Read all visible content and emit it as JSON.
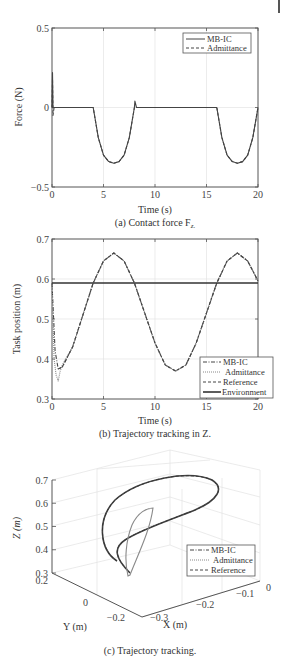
{
  "chart_data": [
    {
      "id": "a",
      "type": "line",
      "title": "",
      "caption": "(a) Contact force F",
      "caption_subscript": "z.",
      "xlabel": "Time (s)",
      "ylabel": "Force (N)",
      "xlim": [
        0,
        20
      ],
      "ylim": [
        -0.5,
        0.5
      ],
      "xticks": [
        "0",
        "5",
        "10",
        "15",
        "20"
      ],
      "yticks": [
        "-0.5",
        "0",
        "0.5"
      ],
      "grid": true,
      "legend_position": "upper right",
      "legend": [
        "MB-IC",
        "Admittance"
      ],
      "series": [
        {
          "name": "MB-IC",
          "style": "solid",
          "color": "#444444",
          "x": [
            0,
            0.05,
            0.1,
            0.2,
            4,
            4.5,
            5,
            5.5,
            6,
            6.5,
            7,
            7.5,
            8,
            8.05,
            8.2,
            16,
            16.5,
            17,
            17.5,
            18,
            18.5,
            19,
            19.5,
            20
          ],
          "y": [
            0,
            0.22,
            0,
            0,
            0,
            -0.19,
            -0.3,
            -0.34,
            -0.35,
            -0.34,
            -0.3,
            -0.19,
            0,
            0.04,
            0,
            0,
            -0.19,
            -0.3,
            -0.34,
            -0.35,
            -0.34,
            -0.3,
            -0.19,
            0
          ]
        },
        {
          "name": "Admittance",
          "style": "dashed",
          "color": "#444444",
          "x": [
            0,
            0.05,
            0.1,
            0.2,
            4,
            4.5,
            5,
            5.5,
            6,
            6.5,
            7,
            7.5,
            8,
            8.2,
            16,
            16.5,
            17,
            17.5,
            18,
            18.5,
            19,
            19.5,
            20
          ],
          "y": [
            0,
            0.18,
            -0.05,
            0,
            0,
            -0.19,
            -0.3,
            -0.34,
            -0.35,
            -0.34,
            -0.3,
            -0.19,
            0,
            0,
            0,
            -0.19,
            -0.3,
            -0.34,
            -0.35,
            -0.34,
            -0.3,
            -0.19,
            0
          ]
        }
      ]
    },
    {
      "id": "b",
      "type": "line",
      "title": "",
      "caption": "(b) Trajectory tracking in Z.",
      "xlabel": "Time (s)",
      "ylabel": "Task position (m)",
      "xlim": [
        0,
        20
      ],
      "ylim": [
        0.3,
        0.7
      ],
      "xticks": [
        "0",
        "5",
        "10",
        "15",
        "20"
      ],
      "yticks": [
        "0.3",
        "0.4",
        "0.5",
        "0.6",
        "0.7"
      ],
      "grid": true,
      "legend_position": "lower right",
      "legend": [
        "MB-IC",
        "Admittance",
        "Reference",
        "Environment"
      ],
      "series": [
        {
          "name": "MB-IC",
          "style": "dashdot",
          "color": "#444444",
          "x": [
            0,
            0.3,
            0.6,
            1,
            2,
            3,
            4,
            5,
            6,
            7,
            8,
            9,
            10,
            11,
            12,
            13,
            14,
            15,
            16,
            17,
            18,
            19,
            20
          ],
          "y": [
            0.59,
            0.42,
            0.375,
            0.38,
            0.43,
            0.51,
            0.59,
            0.645,
            0.665,
            0.645,
            0.59,
            0.515,
            0.44,
            0.385,
            0.37,
            0.385,
            0.44,
            0.515,
            0.59,
            0.645,
            0.665,
            0.645,
            0.595
          ]
        },
        {
          "name": "Admittance",
          "style": "dotted",
          "color": "#888888",
          "x": [
            0,
            0.2,
            0.4,
            0.6,
            0.8,
            1,
            2,
            3,
            4,
            5,
            6,
            7,
            8,
            9,
            10,
            11,
            12,
            13,
            14,
            15,
            16,
            17,
            18,
            19,
            20
          ],
          "y": [
            0.59,
            0.4,
            0.36,
            0.345,
            0.37,
            0.385,
            0.43,
            0.51,
            0.59,
            0.645,
            0.665,
            0.645,
            0.59,
            0.515,
            0.44,
            0.385,
            0.37,
            0.385,
            0.44,
            0.515,
            0.59,
            0.645,
            0.665,
            0.645,
            0.595
          ]
        },
        {
          "name": "Reference",
          "style": "dashed",
          "color": "#444444",
          "x": [
            0.6,
            1,
            2,
            3,
            4,
            5,
            6,
            7,
            8,
            9,
            10,
            11,
            12,
            13,
            14,
            15,
            16,
            17,
            18,
            19,
            20
          ],
          "y": [
            0.375,
            0.38,
            0.43,
            0.51,
            0.59,
            0.645,
            0.665,
            0.645,
            0.59,
            0.515,
            0.44,
            0.385,
            0.37,
            0.385,
            0.44,
            0.515,
            0.59,
            0.645,
            0.665,
            0.645,
            0.595
          ]
        },
        {
          "name": "Environment",
          "style": "solid-thick",
          "color": "#333333",
          "x": [
            0,
            20
          ],
          "y": [
            0.59,
            0.59
          ]
        }
      ]
    },
    {
      "id": "c",
      "type": "line3d",
      "title": "",
      "caption": "(c) Trajectory tracking.",
      "xlabel": "X (m)",
      "ylabel": "Y (m)",
      "zlabel": "Z (m)",
      "xticks": [
        "-0.3",
        "-0.2",
        "-0.1",
        "0"
      ],
      "yticks": [
        "-0.2",
        "0",
        "0.2"
      ],
      "zticks": [
        "0.3",
        "0.4",
        "0.5",
        "0.6",
        "0.7"
      ],
      "zlim": [
        0.3,
        0.7
      ],
      "grid": true,
      "legend_position": "right",
      "legend": [
        "MB-IC",
        "Admittance",
        "Reference"
      ],
      "series": [
        {
          "name": "MB-IC",
          "style": "dashdot",
          "color": "#444444",
          "shape": "large-loop"
        },
        {
          "name": "Admittance",
          "style": "dotted",
          "color": "#888888",
          "shape": "inner-loop"
        },
        {
          "name": "Reference",
          "style": "dashed",
          "color": "#444444",
          "shape": "large-loop"
        }
      ]
    }
  ]
}
